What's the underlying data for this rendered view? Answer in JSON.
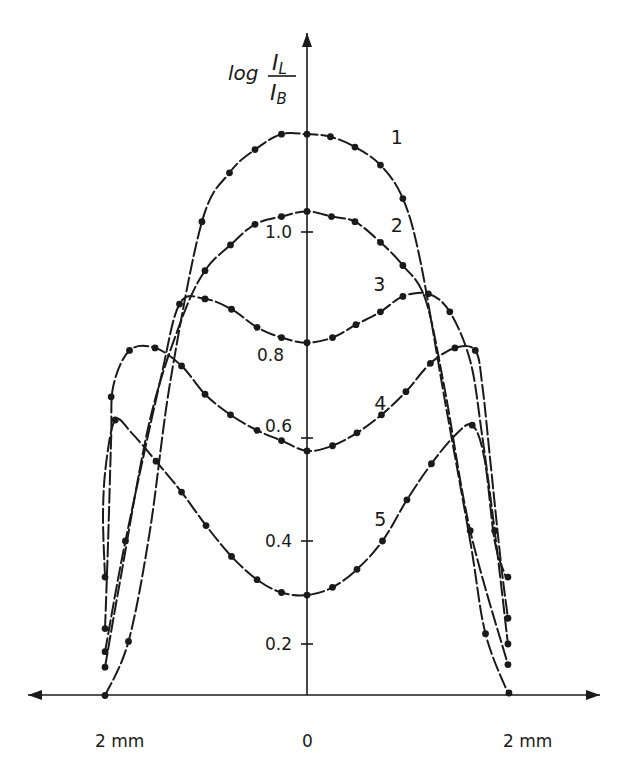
{
  "chart_data": {
    "type": "line",
    "title": "",
    "ylabel": {
      "prefix": "log",
      "numerator": "I",
      "numerator_sub": "L",
      "denominator": "I",
      "denominator_sub": "B"
    },
    "xlabel": "",
    "x_unit": "mm",
    "xlim": [
      -2.7,
      2.9
    ],
    "ylim": [
      0.1,
      1.3
    ],
    "x_tick_labels": [
      {
        "x": -2,
        "label": "2 mm"
      },
      {
        "x": 0,
        "label": "0"
      },
      {
        "x": 2,
        "label": "2 mm"
      }
    ],
    "y_ticks": [
      {
        "y": 0.2,
        "label": "0.2"
      },
      {
        "y": 0.4,
        "label": "0.4"
      },
      {
        "y": 0.6,
        "label": "0.6"
      },
      {
        "y": 0.8,
        "label": "0.8"
      },
      {
        "y": 1.0,
        "label": "1.0"
      }
    ],
    "grid": false,
    "legend": "inline curve labels",
    "series": [
      {
        "name": "1",
        "points": [
          [
            -1.98,
            0.1
          ],
          [
            -1.75,
            0.205
          ],
          [
            -1.54,
            0.42
          ],
          [
            -1.34,
            0.71
          ],
          [
            -1.03,
            1.02
          ],
          [
            -0.76,
            1.115
          ],
          [
            -0.51,
            1.16
          ],
          [
            -0.25,
            1.19
          ],
          [
            0,
            1.19
          ],
          [
            0.23,
            1.185
          ],
          [
            0.47,
            1.165
          ],
          [
            0.72,
            1.13
          ],
          [
            0.94,
            1.065
          ],
          [
            1.11,
            0.945
          ],
          [
            1.35,
            0.675
          ],
          [
            1.6,
            0.4
          ],
          [
            1.75,
            0.22
          ],
          [
            1.98,
            0.1
          ]
        ],
        "markers": [
          [
            -1.98,
            0.1
          ],
          [
            -1.75,
            0.205
          ],
          [
            -1.03,
            1.02
          ],
          [
            -0.76,
            1.115
          ],
          [
            -0.51,
            1.16
          ],
          [
            -0.25,
            1.19
          ],
          [
            0,
            1.19
          ],
          [
            0.23,
            1.185
          ],
          [
            0.47,
            1.165
          ],
          [
            0.72,
            1.13
          ],
          [
            0.94,
            1.065
          ],
          [
            1.75,
            0.22
          ],
          [
            1.98,
            0.105
          ]
        ],
        "label_at": [
          0.82,
          1.17
        ]
      },
      {
        "name": "2",
        "points": [
          [
            -1.98,
            0.155
          ],
          [
            -1.83,
            0.325
          ],
          [
            -1.54,
            0.635
          ],
          [
            -1.23,
            0.83
          ],
          [
            -1.0,
            0.925
          ],
          [
            -0.75,
            0.975
          ],
          [
            -0.51,
            1.015
          ],
          [
            -0.25,
            1.03
          ],
          [
            0,
            1.04
          ],
          [
            0.24,
            1.03
          ],
          [
            0.47,
            1.02
          ],
          [
            0.72,
            0.98
          ],
          [
            0.94,
            0.935
          ],
          [
            1.16,
            0.87
          ],
          [
            1.35,
            0.695
          ],
          [
            1.6,
            0.42
          ],
          [
            1.97,
            0.16
          ]
        ],
        "markers": [
          [
            -1.98,
            0.155
          ],
          [
            -1.0,
            0.925
          ],
          [
            -0.75,
            0.975
          ],
          [
            -0.51,
            1.015
          ],
          [
            -0.25,
            1.03
          ],
          [
            0,
            1.04
          ],
          [
            0.24,
            1.03
          ],
          [
            0.47,
            1.02
          ],
          [
            0.72,
            0.98
          ],
          [
            0.94,
            0.935
          ],
          [
            1.6,
            0.42
          ],
          [
            1.97,
            0.16
          ]
        ],
        "label_at": [
          0.82,
          1.0
        ]
      },
      {
        "name": "3",
        "points": [
          [
            -1.98,
            0.185
          ],
          [
            -1.78,
            0.4
          ],
          [
            -1.44,
            0.71
          ],
          [
            -1.25,
            0.86
          ],
          [
            -1.0,
            0.87
          ],
          [
            -0.74,
            0.85
          ],
          [
            -0.49,
            0.815
          ],
          [
            -0.25,
            0.795
          ],
          [
            0,
            0.785
          ],
          [
            0.25,
            0.795
          ],
          [
            0.48,
            0.82
          ],
          [
            0.72,
            0.845
          ],
          [
            0.94,
            0.875
          ],
          [
            1.19,
            0.88
          ],
          [
            1.4,
            0.845
          ],
          [
            1.6,
            0.75
          ],
          [
            1.71,
            0.615
          ],
          [
            1.84,
            0.42
          ],
          [
            1.97,
            0.2
          ]
        ],
        "markers": [
          [
            -1.98,
            0.185
          ],
          [
            -1.78,
            0.4
          ],
          [
            -1.25,
            0.86
          ],
          [
            -1.0,
            0.87
          ],
          [
            -0.74,
            0.85
          ],
          [
            -0.49,
            0.815
          ],
          [
            -0.25,
            0.795
          ],
          [
            0,
            0.785
          ],
          [
            0.25,
            0.795
          ],
          [
            0.48,
            0.82
          ],
          [
            0.72,
            0.845
          ],
          [
            0.94,
            0.875
          ],
          [
            1.19,
            0.88
          ],
          [
            1.4,
            0.845
          ],
          [
            1.84,
            0.42
          ],
          [
            1.97,
            0.2
          ]
        ],
        "label_at": [
          0.65,
          0.885
        ]
      },
      {
        "name": "4",
        "points": [
          [
            -1.98,
            0.23
          ],
          [
            -1.95,
            0.4
          ],
          [
            -1.92,
            0.6
          ],
          [
            -1.9,
            0.7
          ],
          [
            -1.74,
            0.77
          ],
          [
            -1.49,
            0.775
          ],
          [
            -1.23,
            0.74
          ],
          [
            -1.0,
            0.685
          ],
          [
            -0.75,
            0.645
          ],
          [
            -0.49,
            0.615
          ],
          [
            -0.25,
            0.595
          ],
          [
            0,
            0.575
          ],
          [
            0.25,
            0.585
          ],
          [
            0.49,
            0.61
          ],
          [
            0.73,
            0.645
          ],
          [
            0.97,
            0.69
          ],
          [
            1.21,
            0.745
          ],
          [
            1.45,
            0.775
          ],
          [
            1.65,
            0.77
          ],
          [
            1.72,
            0.7
          ],
          [
            1.8,
            0.55
          ],
          [
            1.9,
            0.36
          ],
          [
            1.97,
            0.25
          ]
        ],
        "markers": [
          [
            -1.98,
            0.23
          ],
          [
            -1.92,
            0.68
          ],
          [
            -1.74,
            0.77
          ],
          [
            -1.49,
            0.775
          ],
          [
            -1.23,
            0.74
          ],
          [
            -1.0,
            0.685
          ],
          [
            -0.75,
            0.645
          ],
          [
            -0.49,
            0.615
          ],
          [
            -0.25,
            0.595
          ],
          [
            0,
            0.575
          ],
          [
            0.25,
            0.585
          ],
          [
            0.49,
            0.61
          ],
          [
            0.73,
            0.645
          ],
          [
            0.97,
            0.69
          ],
          [
            1.21,
            0.745
          ],
          [
            1.45,
            0.775
          ],
          [
            1.65,
            0.77
          ],
          [
            1.97,
            0.25
          ]
        ],
        "label_at": [
          0.66,
          0.655
        ]
      },
      {
        "name": "5",
        "points": [
          [
            -1.98,
            0.33
          ],
          [
            -2.0,
            0.45
          ],
          [
            -1.97,
            0.55
          ],
          [
            -1.88,
            0.635
          ],
          [
            -1.72,
            0.61
          ],
          [
            -1.48,
            0.555
          ],
          [
            -1.23,
            0.495
          ],
          [
            -0.99,
            0.43
          ],
          [
            -0.74,
            0.37
          ],
          [
            -0.49,
            0.325
          ],
          [
            -0.25,
            0.3
          ],
          [
            0,
            0.295
          ],
          [
            0.25,
            0.31
          ],
          [
            0.49,
            0.345
          ],
          [
            0.74,
            0.4
          ],
          [
            0.98,
            0.48
          ],
          [
            1.22,
            0.55
          ],
          [
            1.45,
            0.605
          ],
          [
            1.62,
            0.625
          ],
          [
            1.74,
            0.56
          ],
          [
            1.84,
            0.4
          ],
          [
            1.95,
            0.33
          ]
        ],
        "markers": [
          [
            -1.98,
            0.33
          ],
          [
            -1.88,
            0.635
          ],
          [
            -1.48,
            0.555
          ],
          [
            -1.23,
            0.495
          ],
          [
            -0.99,
            0.43
          ],
          [
            -0.74,
            0.37
          ],
          [
            -0.49,
            0.325
          ],
          [
            -0.25,
            0.3
          ],
          [
            0,
            0.295
          ],
          [
            0.25,
            0.31
          ],
          [
            0.49,
            0.345
          ],
          [
            0.74,
            0.4
          ],
          [
            0.98,
            0.48
          ],
          [
            1.22,
            0.55
          ],
          [
            1.62,
            0.625
          ],
          [
            1.97,
            0.33
          ]
        ],
        "label_at": [
          0.66,
          0.43
        ]
      }
    ]
  }
}
